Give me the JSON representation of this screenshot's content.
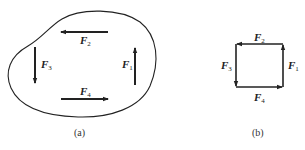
{
  "figure_a": {
    "caption": "(a)",
    "forces": [
      {
        "name": "F",
        "sub": "1",
        "direction": "up"
      },
      {
        "name": "F",
        "sub": "2",
        "direction": "left"
      },
      {
        "name": "F",
        "sub": "3",
        "direction": "down"
      },
      {
        "name": "F",
        "sub": "4",
        "direction": "right"
      }
    ]
  },
  "figure_b": {
    "caption": "(b)",
    "forces": [
      {
        "name": "F",
        "sub": "1",
        "direction": "up"
      },
      {
        "name": "F",
        "sub": "2",
        "direction": "left"
      },
      {
        "name": "F",
        "sub": "3",
        "direction": "down"
      },
      {
        "name": "F",
        "sub": "4",
        "direction": "right"
      }
    ]
  },
  "colors": {
    "stroke": "#222222",
    "background": "#ffffff"
  }
}
